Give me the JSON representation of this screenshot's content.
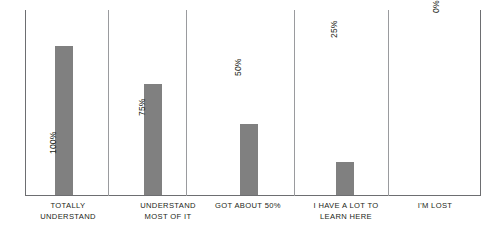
{
  "chart_data": {
    "type": "bar",
    "title": "",
    "subtitle": "",
    "xlabel": "",
    "ylabel": "",
    "ylim": [
      0,
      100
    ],
    "grid": false,
    "legend": false,
    "orientation": "vertical",
    "bar_color": "#808080",
    "axis_color": "#6d6e71",
    "divider_color": "#9a9b9e",
    "categories": [
      "TOTALLY\nUNDERSTAND",
      "UNDERSTAND\nMOST OF IT",
      "GOT ABOUT 50%",
      "I HAVE A LOT TO\nLEARN HERE",
      "I'M LOST"
    ],
    "values": [
      100,
      75,
      50,
      25,
      0
    ],
    "data_labels": [
      "100%",
      "75%",
      "50%",
      "25%",
      "0%"
    ],
    "data_label_rotation": "90deg-ccw"
  },
  "bars": [
    {
      "category": "TOTALLY\nUNDERSTAND",
      "value": 100,
      "label": "100%",
      "cell_left": 0,
      "cell_width": 108,
      "bar_left": 30,
      "bar_height": 149,
      "label_left": 33,
      "label_bottom": 42
    },
    {
      "category": "UNDERSTAND\nMOST OF IT",
      "value": 75,
      "label": "75%",
      "cell_left": 109,
      "cell_width": 77,
      "bar_left": 10,
      "bar_height": 111,
      "label_left": 13,
      "label_bottom": 80
    },
    {
      "category": "GOT ABOUT 50%",
      "value": 50,
      "label": "50%",
      "cell_left": 187,
      "cell_width": 107,
      "bar_left": 28,
      "bar_height": 71,
      "label_left": 31,
      "label_bottom": 120
    },
    {
      "category": "I HAVE A LOT TO\nLEARN HERE",
      "value": 25,
      "label": "25%",
      "cell_left": 295,
      "cell_width": 93,
      "bar_left": 16,
      "bar_height": 33,
      "label_left": 19,
      "label_bottom": 158
    },
    {
      "category": "I'M LOST",
      "value": 0,
      "label": "0%",
      "cell_left": 389,
      "cell_width": 66,
      "bar_left": 24,
      "bar_height": 0,
      "label_left": 27,
      "label_bottom": 183
    }
  ],
  "cat_labels": [
    {
      "text": "TOTALLY\nUNDERSTAND",
      "left": 14,
      "width": 108
    },
    {
      "text": "UNDERSTAND\nMOST OF IT",
      "left": 120,
      "width": 96
    },
    {
      "text": "GOT ABOUT 50%",
      "left": 201,
      "width": 94
    },
    {
      "text": "I HAVE A LOT TO\nLEARN HERE",
      "left": 296,
      "width": 100
    },
    {
      "text": "I'M LOST",
      "left": 400,
      "width": 70
    }
  ],
  "dividers": [
    {
      "left": 83
    },
    {
      "left": 161
    },
    {
      "left": 269
    },
    {
      "left": 363
    }
  ]
}
